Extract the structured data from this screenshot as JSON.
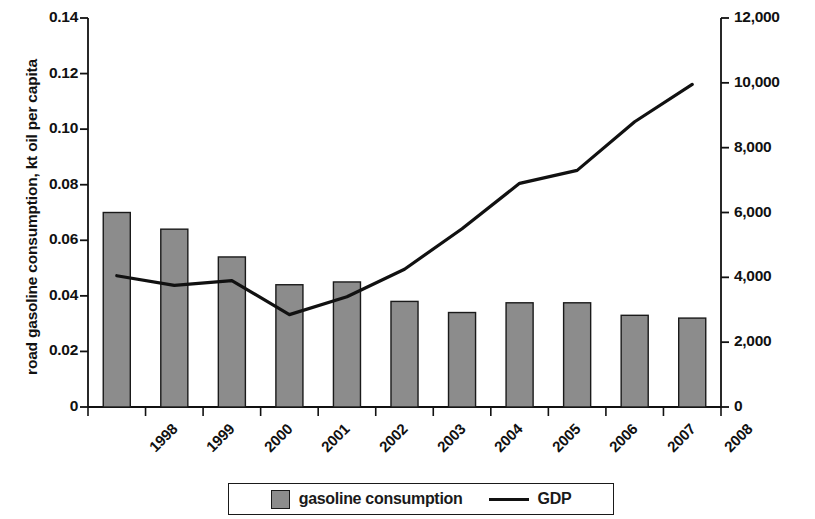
{
  "chart_data": {
    "type": "bar",
    "title": "",
    "categories": [
      "1998",
      "1999",
      "2000",
      "2001",
      "2002",
      "2003",
      "2004",
      "2005",
      "2006",
      "2007",
      "2008"
    ],
    "series": [
      {
        "name": "gasoline consumption",
        "type": "bar",
        "axis": "left",
        "color": "#8c8c8c",
        "values": [
          0.07,
          0.064,
          0.054,
          0.044,
          0.045,
          0.038,
          0.034,
          0.0375,
          0.0375,
          0.033,
          0.032
        ]
      },
      {
        "name": "GDP",
        "type": "line",
        "axis": "right",
        "color": "#111111",
        "values": [
          4050,
          3750,
          3900,
          2850,
          3400,
          4250,
          5500,
          6900,
          7300,
          8800,
          9950
        ]
      }
    ],
    "xlabel": "",
    "ylabel": "road gasoline consumption, kt oil per capita",
    "y2label": "GDP, US$ per capita",
    "ylim": [
      0,
      0.14
    ],
    "y2lim": [
      0,
      12000
    ],
    "yticks": [
      "0",
      "0.02",
      "0.04",
      "0.06",
      "0.08",
      "0.10",
      "0.12",
      "0.14"
    ],
    "ytick_values": [
      0,
      0.02,
      0.04,
      0.06,
      0.08,
      0.1,
      0.12,
      0.14
    ],
    "y2ticks": [
      "0",
      "2,000",
      "4,000",
      "6,000",
      "8,000",
      "10,000",
      "12,000"
    ],
    "y2tick_values": [
      0,
      2000,
      4000,
      6000,
      8000,
      10000,
      12000
    ],
    "grid": false,
    "legend_position": "bottom",
    "legend": [
      {
        "label": "gasoline consumption",
        "marker": "square",
        "color": "#8c8c8c"
      },
      {
        "label": "GDP",
        "marker": "line",
        "color": "#111111"
      }
    ]
  }
}
